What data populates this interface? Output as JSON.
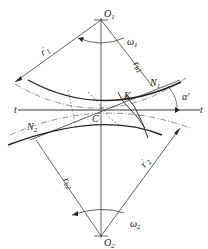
{
  "diagram": {
    "type": "gear-meshing",
    "labels": {
      "o1": "O",
      "o1_sub": "1",
      "o2": "O",
      "o2_sub": "2",
      "omega1": "ω",
      "omega1_sub": "1",
      "omega2": "ω",
      "omega2_sub": "2",
      "r1": "r",
      "r1_prime": "′",
      "r1_sub": "1",
      "r2": "r",
      "r2_prime": "′",
      "r2_sub": "2",
      "rb1": "r",
      "rb1_sub": "b1",
      "rb2": "r",
      "rb2_sub": "b2",
      "n1": "N",
      "n1_sub": "1",
      "n2": "N",
      "n2_sub": "2",
      "k": "K",
      "c": "C",
      "t_left": "t",
      "t_right": "t",
      "alpha": "α′"
    },
    "colors": {
      "line": "#222222",
      "background": "#ffffff"
    }
  }
}
